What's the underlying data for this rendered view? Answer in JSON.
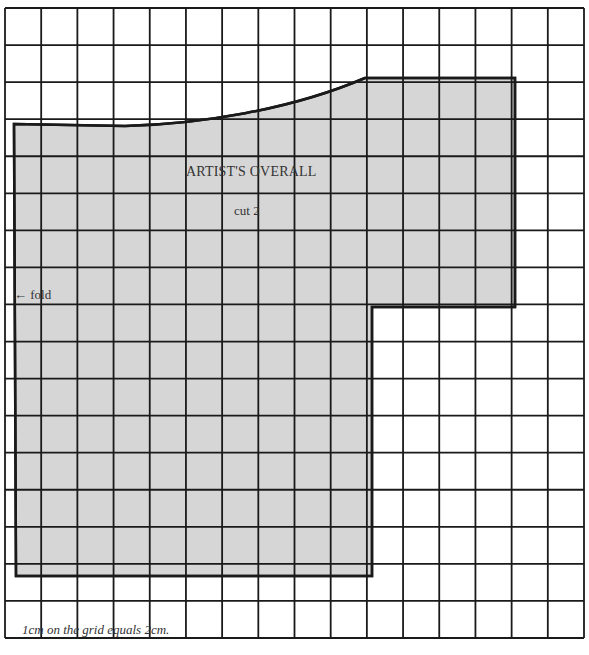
{
  "pattern": {
    "title": "ARTIST'S OVERALL",
    "instruction": "cut 2",
    "fold_marker": "← fold",
    "fold_label": "fold"
  },
  "caption": "1cm on the grid equals 2cm.",
  "grid": {
    "columns": 16,
    "rows": 17,
    "x0": 5,
    "x1": 584,
    "y0": 8,
    "y1": 638,
    "line_color": "#1a1a1a"
  },
  "piece": {
    "fill": "#d4d4d4",
    "outline_color": "#1a1a1a",
    "outline": [
      [
        14,
        124
      ],
      [
        125,
        126
      ],
      "curve",
      [
        365,
        78
      ],
      [
        515,
        78
      ],
      [
        515,
        307
      ],
      [
        372,
        307
      ],
      [
        372,
        576
      ],
      [
        16,
        576
      ]
    ]
  }
}
